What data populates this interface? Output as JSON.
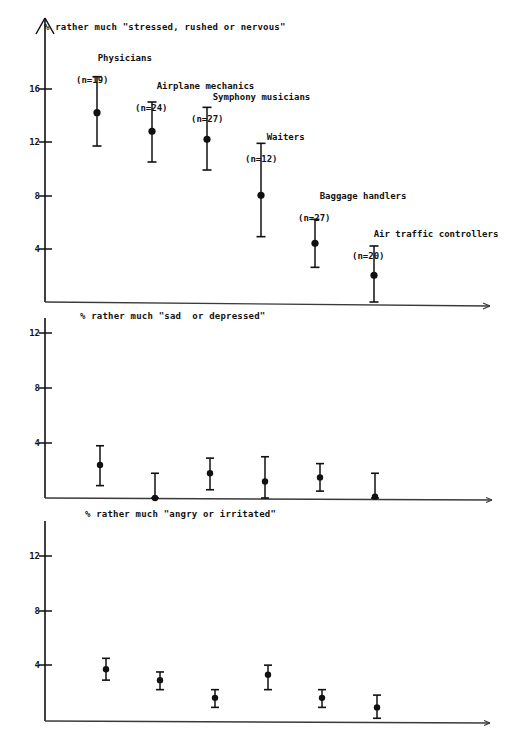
{
  "figure": {
    "width": 506,
    "height": 749,
    "background": "#ffffff",
    "ink_color": "#111111"
  },
  "chart_data": [
    {
      "type": "scatter",
      "id": "panel-stressed",
      "title": "% rather much \"stressed, rushed or nervous\"",
      "xlabel": "",
      "ylabel": "%",
      "ylim": [
        0,
        18
      ],
      "yticks": [
        4,
        8,
        12,
        16
      ],
      "ytick_labels": [
        "4",
        "8",
        "12",
        "16"
      ],
      "grid": false,
      "legend": "none",
      "error_bars": "vertical, capped (95% CI)",
      "categories": [
        "Physicians",
        "Airplane mechanics",
        "Symphony musicians",
        "Waiters",
        "Baggage handlers",
        "Air traffic controllers"
      ],
      "group_labels": [
        "Physicians\n(n=19)",
        "Airplane mechanics\n(n=24)",
        "Symphony musicians\n(n=27)",
        "Waiters\n(n=12)",
        "Baggage handlers\n(n=27)",
        "Air traffic controllers\n(n=20)"
      ],
      "n": [
        19,
        24,
        27,
        12,
        27,
        20
      ],
      "values": [
        14.2,
        12.8,
        12.2,
        8.0,
        4.4,
        2.0
      ],
      "ci_low": [
        11.7,
        10.5,
        9.9,
        4.9,
        2.6,
        0.0
      ],
      "ci_high": [
        16.9,
        15.0,
        14.6,
        11.9,
        6.2,
        4.2
      ]
    },
    {
      "type": "scatter",
      "id": "panel-sad",
      "title": "% rather much \"sad  or depressed\"",
      "xlabel": "",
      "ylabel": "%",
      "ylim": [
        0,
        14
      ],
      "yticks": [
        4,
        8,
        12
      ],
      "ytick_labels": [
        "4",
        "8",
        "12"
      ],
      "grid": false,
      "legend": "none",
      "error_bars": "vertical, capped (95% CI)",
      "categories": [
        "Physicians",
        "Airplane mechanics",
        "Symphony musicians",
        "Waiters",
        "Baggage handlers",
        "Air traffic controllers"
      ],
      "n": [
        19,
        24,
        27,
        12,
        27,
        20
      ],
      "values": [
        2.4,
        0.0,
        1.8,
        1.2,
        1.5,
        0.1
      ],
      "ci_low": [
        0.9,
        0.0,
        0.6,
        0.0,
        0.5,
        0.0
      ],
      "ci_high": [
        3.8,
        1.8,
        2.9,
        3.0,
        2.5,
        1.8
      ]
    },
    {
      "type": "scatter",
      "id": "panel-angry",
      "title": "% rather much \"angry or irritated\"",
      "xlabel": "",
      "ylabel": "%",
      "ylim": [
        0,
        15
      ],
      "yticks": [
        4,
        8,
        12
      ],
      "ytick_labels": [
        "4",
        "8",
        "12"
      ],
      "grid": false,
      "legend": "none",
      "error_bars": "vertical, capped (95% CI)",
      "categories": [
        "Physicians",
        "Airplane mechanics",
        "Symphony musicians",
        "Waiters",
        "Baggage handlers",
        "Air traffic controllers"
      ],
      "n": [
        19,
        24,
        27,
        12,
        27,
        20
      ],
      "values": [
        3.8,
        3.0,
        1.7,
        3.4,
        1.7,
        1.0
      ],
      "ci_low": [
        3.0,
        2.3,
        1.0,
        2.3,
        1.0,
        0.2
      ],
      "ci_high": [
        4.6,
        3.6,
        2.3,
        4.1,
        2.3,
        1.9
      ]
    }
  ]
}
